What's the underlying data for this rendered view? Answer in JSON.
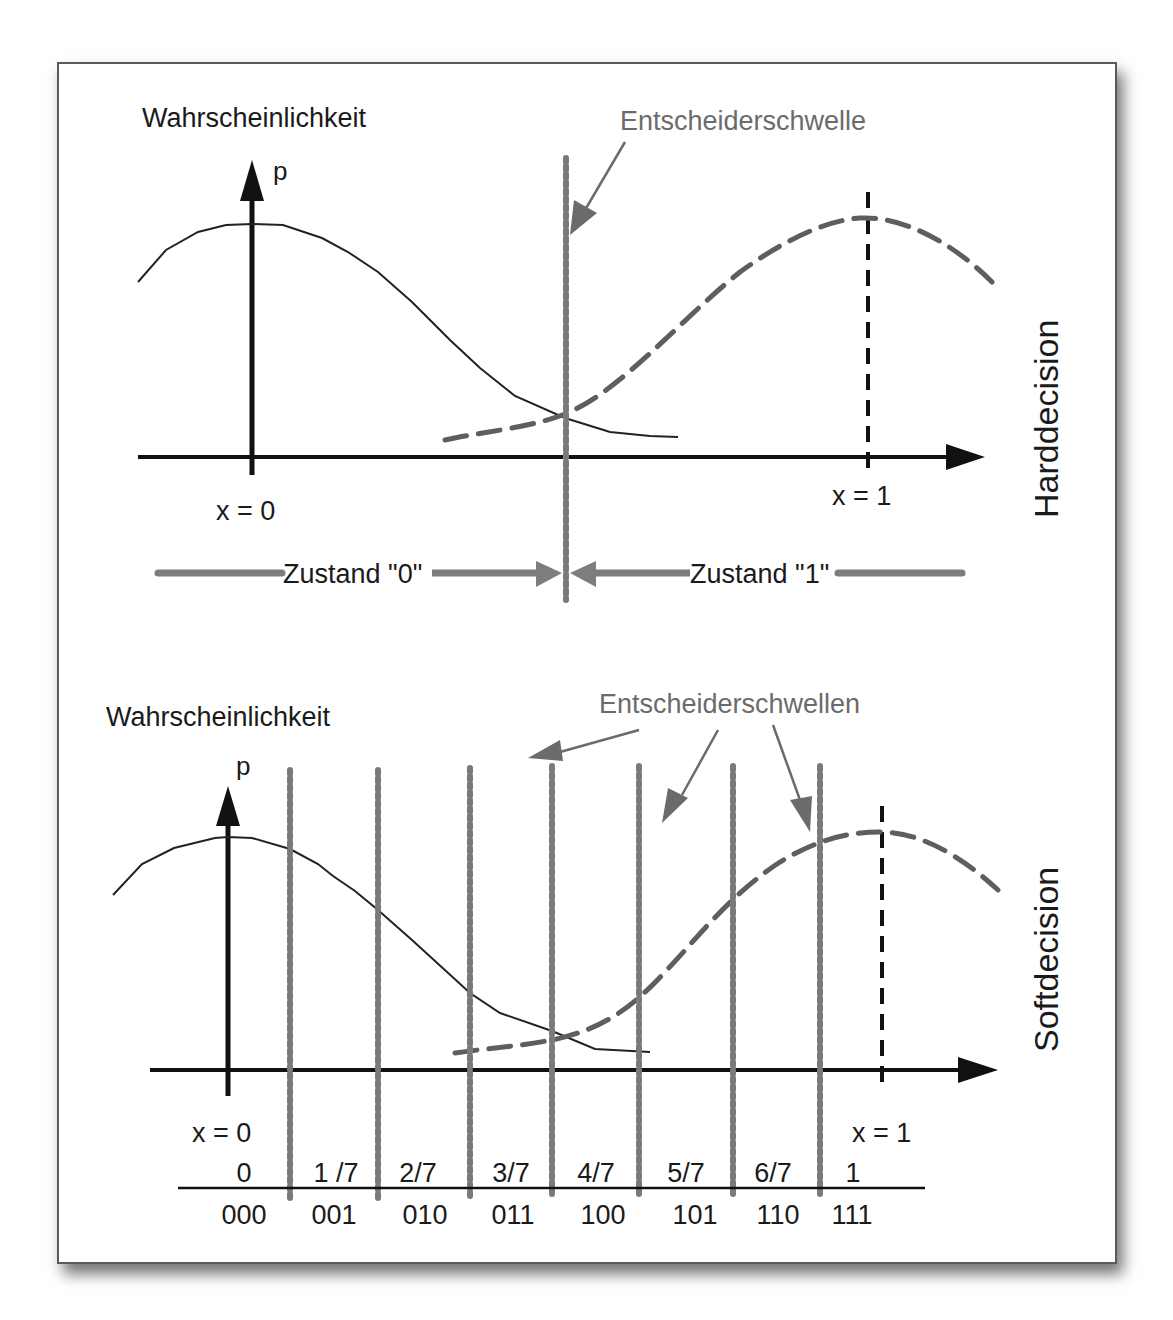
{
  "diagram": {
    "top_panel": {
      "y_axis_title": "Wahrscheinlichkeit",
      "y_axis_symbol": "p",
      "threshold_label": "Entscheiderschwelle",
      "x0_label": "x = 0",
      "x1_label": "x = 1",
      "side_label": "Harddecision",
      "zone0_label": "Zustand \"0\"",
      "zone1_label": "Zustand \"1\""
    },
    "bottom_panel": {
      "y_axis_title": "Wahrscheinlichkeit",
      "y_axis_symbol": "p",
      "threshold_label": "Entscheiderschwellen",
      "x0_label": "x = 0",
      "x1_label": "x = 1",
      "side_label": "Softdecision",
      "levels": [
        "0",
        "1 /7",
        "2/7",
        "3/7",
        "4/7",
        "5/7",
        "6/7",
        "1"
      ],
      "codes": [
        "000",
        "001",
        "010",
        "011",
        "100",
        "101",
        "110",
        "111"
      ]
    },
    "colors": {
      "text": "#1a1a1a",
      "annotation": "#6b6b6b",
      "threshold_dots": "#7a7a7a",
      "dashed_curve": "#5e5e5e",
      "axis": "#111111",
      "zone_bar": "#7d7d7d"
    },
    "icons": {
      "y_axis_arrow": "arrow-up",
      "x_axis_arrow": "arrow-right",
      "annotation_arrow": "arrow-diagonal"
    }
  }
}
